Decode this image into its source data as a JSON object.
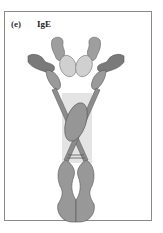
{
  "figure": {
    "panel_label": "(e)",
    "title": "IgE"
  },
  "colors": {
    "frame": "#8a8a8a",
    "dark_domain": "#7d7d7d",
    "mid_domain": "#9b9b9b",
    "light_domain": "#cfcfcf",
    "highlight_box": "#e3e3e3",
    "outline": "#5a5a5a"
  }
}
